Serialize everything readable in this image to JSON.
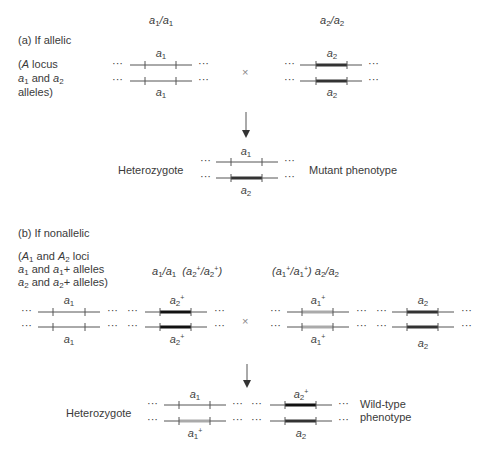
{
  "panel_a": {
    "heading": "(a) If allelic",
    "note_lines": [
      "(A locus",
      "a1 and a2",
      "alleles)"
    ],
    "parent1_genotype": "a1/a1",
    "parent2_genotype": "a2/a2",
    "parent1_allele_top": "a1",
    "parent1_allele_bottom": "a1",
    "parent2_allele_top": "a2",
    "parent2_allele_bottom": "a2",
    "cross_symbol": "×",
    "offspring_label": "Heterozygote",
    "offspring_allele_top": "a1",
    "offspring_allele_bottom": "a2",
    "phenotype": "Mutant phenotype"
  },
  "panel_b": {
    "heading": "(b) If nonallelic",
    "note_lines": [
      "(A1 and A2 loci",
      "a1 and a1+ alleles",
      "a2 and a2+ alleles)"
    ],
    "parent1_genotype": "a1/a1  (a2+/a2+)",
    "parent2_genotype": "(a1+/a1+) a2/a2",
    "parent1_alleles": {
      "locus1_top": "a1",
      "locus1_bottom": "a1",
      "locus2_top": "a2+",
      "locus2_bottom": "a2+"
    },
    "parent2_alleles": {
      "locus1_top": "a1+",
      "locus1_bottom": "a1+",
      "locus2_top": "a2",
      "locus2_bottom": "a2"
    },
    "cross_symbol": "×",
    "offspring_label": "Heterozygote",
    "offspring_alleles": {
      "locus1_top": "a1",
      "locus1_bottom": "a1+",
      "locus2_top": "a2+",
      "locus2_bottom": "a2"
    },
    "phenotype_lines": [
      "Wild-type",
      "phenotype"
    ]
  },
  "ellipsis": "···",
  "colors": {
    "line": "#555555",
    "mutant_a2": "#333333",
    "wildtype_plus": "#aaaaaa",
    "text": "#3a3a3a"
  }
}
